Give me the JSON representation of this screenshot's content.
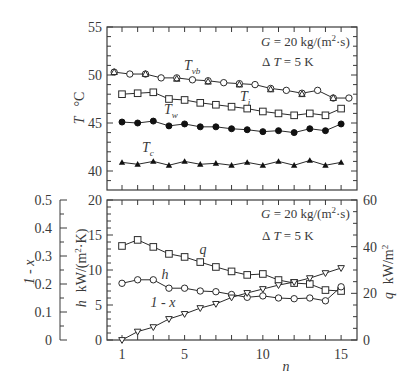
{
  "chart_data": [
    {
      "type": "line",
      "panel": "top",
      "title": "",
      "annotation": [
        "G = 20 kg/(m²·s)",
        "ΔT = 5 K"
      ],
      "xlabel": "",
      "ylabel": "T  °C",
      "ylim": [
        38.5,
        55
      ],
      "yticks": [
        40,
        45,
        50,
        55
      ],
      "xlim": [
        0.05,
        16
      ],
      "grid": false,
      "legend": "inline labels",
      "series": [
        {
          "name": "T_vb",
          "label_main": "T",
          "label_sub": "vb",
          "marker": "open-circle",
          "x": [
            0.5,
            1.5,
            2.5,
            3.5,
            4.5,
            5.5,
            6.5,
            7.5,
            8.5,
            9.5,
            10.5,
            11.5,
            12.5,
            13.5,
            14.5,
            15.5
          ],
          "values": [
            50.3,
            50.1,
            50.1,
            49.7,
            49.7,
            49.5,
            49.4,
            49.2,
            49.1,
            49.0,
            48.6,
            48.4,
            48.1,
            48.4,
            47.6,
            47.6
          ]
        },
        {
          "name": "T_vb (triangle overlay)",
          "marker": "open-triangle",
          "x": [
            0.5,
            2.5,
            4.5,
            6.5,
            8.5,
            10.5,
            12.5,
            14.5
          ],
          "values": [
            50.3,
            50.1,
            49.6,
            49.3,
            49.0,
            48.5,
            48.0,
            47.6
          ]
        },
        {
          "name": "T_i",
          "label_main": "T",
          "label_sub": "i",
          "marker": "open-square",
          "x": [
            1,
            2,
            3,
            4,
            5,
            6,
            7,
            8,
            9,
            10,
            11,
            12,
            13,
            14,
            15
          ],
          "values": [
            48.0,
            48.1,
            48.2,
            47.5,
            47.4,
            47.1,
            46.9,
            46.7,
            46.5,
            46.2,
            46.0,
            45.8,
            46.0,
            45.8,
            46.5
          ]
        },
        {
          "name": "T_w",
          "label_main": "T",
          "label_sub": "w",
          "marker": "filled-circle",
          "x": [
            1,
            2,
            3,
            4,
            5,
            6,
            7,
            8,
            9,
            10,
            11,
            12,
            13,
            14,
            15
          ],
          "values": [
            45.1,
            45.0,
            45.2,
            44.7,
            44.9,
            44.6,
            44.6,
            44.4,
            44.3,
            44.1,
            44.2,
            44.0,
            44.4,
            44.2,
            44.9
          ]
        },
        {
          "name": "T_c",
          "label_main": "T",
          "label_sub": "c",
          "marker": "filled-triangle",
          "x": [
            1,
            2,
            3,
            4,
            5,
            6,
            7,
            8,
            9,
            10,
            11,
            12,
            13,
            14,
            15
          ],
          "values": [
            40.9,
            40.7,
            41.0,
            40.6,
            41.0,
            40.7,
            40.8,
            40.6,
            40.9,
            40.6,
            41.0,
            40.6,
            41.1,
            40.6,
            40.9
          ]
        }
      ]
    },
    {
      "type": "line",
      "panel": "bottom",
      "title": "",
      "annotation": [
        "G = 20 kg/(m²·s)",
        "ΔT = 5 K"
      ],
      "xlabel": "n",
      "xticks": [
        1,
        5,
        10,
        15
      ],
      "xlim": [
        0.05,
        16
      ],
      "ylabel_left_outer": "1 - x",
      "ylim_left_outer": [
        0,
        0.5
      ],
      "yticks_left_outer": [
        0,
        0.1,
        0.2,
        0.3,
        0.4,
        0.5
      ],
      "ylabel": "h  kW/(m²·K)",
      "ylim": [
        0,
        20
      ],
      "yticks": [
        0,
        5,
        10,
        15,
        20
      ],
      "ylabel_right": "q  kW/m²",
      "ylim_right": [
        0,
        60
      ],
      "yticks_right": [
        0,
        20,
        40,
        60
      ],
      "grid": false,
      "legend": "inline labels",
      "series": [
        {
          "name": "q",
          "axis": "right",
          "marker": "open-square",
          "x": [
            1,
            2,
            3,
            4,
            5,
            6,
            7,
            8,
            9,
            10,
            11,
            12,
            13,
            14,
            15
          ],
          "values": [
            40.3,
            42.9,
            39.9,
            36.9,
            35.6,
            33.4,
            31.3,
            29.4,
            27.9,
            28.3,
            25.7,
            24.4,
            24.0,
            21.4,
            21.0
          ]
        },
        {
          "name": "h",
          "axis": "left",
          "marker": "open-circle",
          "x": [
            1,
            2,
            3,
            4,
            5,
            6,
            7,
            8,
            9,
            10,
            11,
            12,
            13,
            14,
            15
          ],
          "values": [
            8.1,
            8.6,
            8.6,
            7.4,
            7.4,
            7.0,
            6.9,
            6.5,
            6.1,
            6.3,
            6.0,
            5.9,
            6.0,
            5.6,
            7.6
          ]
        },
        {
          "name": "1 - x",
          "axis": "left_outer",
          "marker": "open-triangle-down",
          "x": [
            1,
            2,
            3,
            4,
            5,
            6,
            7,
            8,
            9,
            10,
            11,
            12,
            13,
            14,
            15
          ],
          "values": [
            0.0,
            0.03,
            0.046,
            0.075,
            0.093,
            0.114,
            0.129,
            0.152,
            0.168,
            0.182,
            0.196,
            0.207,
            0.221,
            0.239,
            0.257
          ]
        }
      ]
    }
  ],
  "labels": {
    "top_ylabel_T": "T",
    "top_ylabel_unit": "°C",
    "annot_G": "G",
    "annot_G_rest": " = 20 kg/(m",
    "annot_G_sup": "2",
    "annot_G_end": "·s)",
    "annot_dT": "Δ",
    "annot_dT_T": "T",
    "annot_dT_rest": " = 5 K",
    "bottom_ylabel_h": "h",
    "bottom_ylabel_h_unit": "kW/(m",
    "bottom_ylabel_h_sup": "2",
    "bottom_ylabel_h_end": "·K)",
    "bottom_ylabel_1x": "1 - x",
    "bottom_ylabel_q": "q",
    "bottom_ylabel_q_unit": "kW/m",
    "bottom_ylabel_q_sup": "2",
    "xlabel": "n",
    "series_q": "q",
    "series_h": "h",
    "series_1x": "1 - x"
  }
}
